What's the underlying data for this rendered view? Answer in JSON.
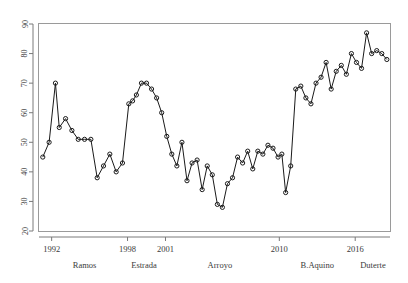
{
  "chart_data": {
    "type": "line",
    "title": "",
    "subtitle": "",
    "xlabel": "",
    "ylabel": "",
    "grid": false,
    "legend": false,
    "legend_position": "none",
    "marker": "open-circle",
    "xlim": [
      1991.0,
      2018.75
    ],
    "ylim": [
      20,
      90
    ],
    "ytick_labels": [
      "20",
      "30",
      "40",
      "50",
      "60",
      "70",
      "80",
      "90"
    ],
    "ytick_values": [
      20,
      30,
      40,
      50,
      60,
      70,
      80,
      90
    ],
    "xtick_labels": [
      "1992",
      "1998",
      "2001",
      "2010",
      "2016"
    ],
    "xtick_values": [
      1992,
      1998,
      2001,
      2010,
      2016
    ],
    "era_annotations": [
      {
        "label": "Ramos",
        "x": 1994.6
      },
      {
        "label": "Estrada",
        "x": 1999.3
      },
      {
        "label": "Arroyo",
        "x": 2005.3
      },
      {
        "label": "B.Aquino",
        "x": 2013.0
      },
      {
        "label": "Duterte",
        "x": 2017.4
      }
    ],
    "series": [
      {
        "name": "rating",
        "color": "#1a1a1a",
        "x": [
          1991.3,
          1991.8,
          1992.3,
          1992.6,
          1993.1,
          1993.6,
          1994.1,
          1994.6,
          1995.1,
          1995.6,
          1996.1,
          1996.6,
          1997.1,
          1997.6,
          1998.1,
          1998.4,
          1998.7,
          1999.1,
          1999.5,
          1999.9,
          2000.3,
          2000.7,
          2001.1,
          2001.5,
          2001.9,
          2002.3,
          2002.7,
          2003.1,
          2003.5,
          2003.9,
          2004.3,
          2004.7,
          2005.1,
          2005.5,
          2005.9,
          2006.3,
          2006.7,
          2007.1,
          2007.5,
          2007.9,
          2008.3,
          2008.7,
          2009.1,
          2009.5,
          2009.9,
          2010.2,
          2010.5,
          2010.9,
          2011.3,
          2011.7,
          2012.1,
          2012.5,
          2012.9,
          2013.3,
          2013.7,
          2014.1,
          2014.5,
          2014.9,
          2015.3,
          2015.7,
          2016.1,
          2016.5,
          2016.9,
          2017.3,
          2017.7,
          2018.1,
          2018.5
        ],
        "y": [
          45,
          50,
          70,
          55,
          58,
          54,
          51,
          51,
          51,
          38,
          42,
          46,
          40,
          43,
          63,
          64,
          66,
          70,
          70,
          68,
          65,
          60,
          52,
          46,
          42,
          50,
          37,
          43,
          44,
          34,
          42,
          39,
          29,
          28,
          36,
          38,
          45,
          43,
          47,
          41,
          47,
          46,
          49,
          48,
          45,
          46,
          33,
          42,
          68,
          69,
          65,
          63,
          70,
          72,
          77,
          68,
          74,
          76,
          73,
          80,
          77,
          75,
          87,
          80,
          81,
          80,
          78
        ]
      }
    ]
  }
}
